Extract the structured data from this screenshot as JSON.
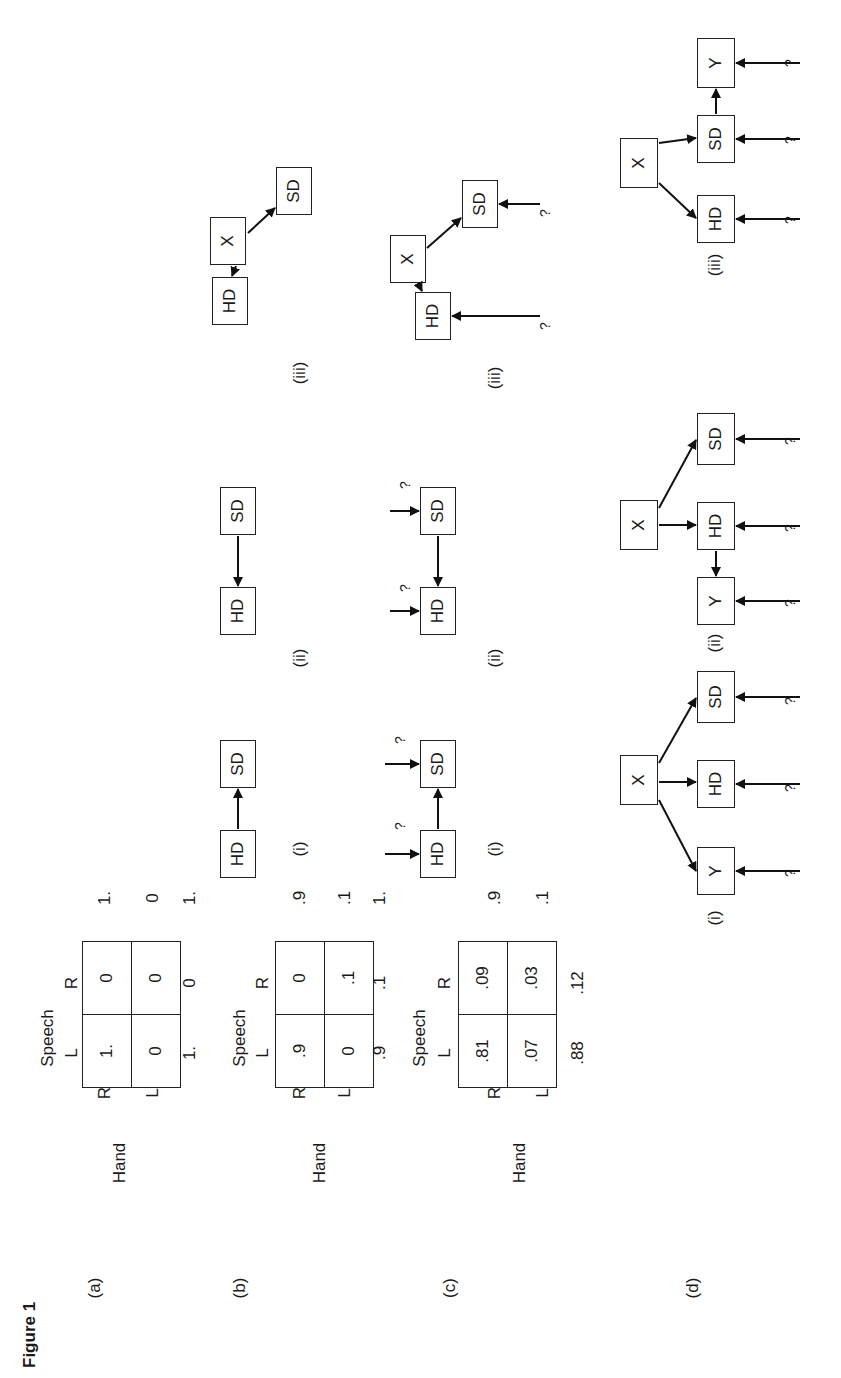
{
  "figure": {
    "caption": "Figure 1",
    "orientation": "rotated 90° counter-clockwise",
    "rows": [
      {
        "label": "(a)",
        "table": {
          "row_var": "Hand",
          "col_var": "Speech",
          "row_labels": [
            "R",
            "L"
          ],
          "col_labels": [
            "L",
            "R"
          ],
          "cells": [
            [
              "1.",
              "0"
            ],
            [
              "0",
              "0"
            ]
          ],
          "row_totals": [
            "1.",
            "0"
          ],
          "col_totals": [
            "1.",
            "0"
          ],
          "grand_total": "1."
        },
        "diagrams": []
      },
      {
        "label": "(b)",
        "table": {
          "row_var": "Hand",
          "col_var": "Speech",
          "row_labels": [
            "R",
            "L"
          ],
          "col_labels": [
            "L",
            "R"
          ],
          "cells": [
            [
              ".9",
              "0"
            ],
            [
              "0",
              ".1"
            ]
          ],
          "row_totals": [
            ".9",
            ".1"
          ],
          "col_totals": [
            ".9",
            ".1"
          ],
          "grand_total": "1."
        },
        "diagrams": [
          {
            "label": "(i)",
            "nodes": [
              "HD",
              "SD"
            ],
            "edges": [
              [
                "HD",
                "SD"
              ]
            ],
            "error_inputs": []
          },
          {
            "label": "(ii)",
            "nodes": [
              "HD",
              "SD"
            ],
            "edges": [
              [
                "SD",
                "HD"
              ]
            ],
            "error_inputs": []
          },
          {
            "label": "(iii)",
            "nodes": [
              "X",
              "HD",
              "SD"
            ],
            "edges": [
              [
                "X",
                "HD"
              ],
              [
                "X",
                "SD"
              ]
            ],
            "error_inputs": []
          }
        ]
      },
      {
        "label": "(c)",
        "table": {
          "row_var": "Hand",
          "col_var": "Speech",
          "row_labels": [
            "R",
            "L"
          ],
          "col_labels": [
            "L",
            "R"
          ],
          "cells": [
            [
              ".81",
              ".09"
            ],
            [
              ".07",
              ".03"
            ]
          ],
          "row_totals": [
            ".9",
            ".1"
          ],
          "col_totals": [
            ".88",
            ".12"
          ]
        },
        "diagrams": [
          {
            "label": "(i)",
            "nodes": [
              "HD",
              "SD"
            ],
            "edges": [
              [
                "HD",
                "SD"
              ]
            ],
            "error_inputs": [
              "HD",
              "SD"
            ],
            "error_symbol": "?"
          },
          {
            "label": "(ii)",
            "nodes": [
              "HD",
              "SD"
            ],
            "edges": [
              [
                "SD",
                "HD"
              ]
            ],
            "error_inputs": [
              "HD",
              "SD"
            ],
            "error_symbol": "?"
          },
          {
            "label": "(iii)",
            "nodes": [
              "X",
              "HD",
              "SD"
            ],
            "edges": [
              [
                "X",
                "HD"
              ],
              [
                "X",
                "SD"
              ]
            ],
            "error_inputs": [
              "HD",
              "SD"
            ],
            "error_symbol": "?"
          }
        ]
      },
      {
        "label": "(d)",
        "diagrams": [
          {
            "label": "(i)",
            "nodes": [
              "X",
              "Y",
              "HD",
              "SD"
            ],
            "edges": [
              [
                "X",
                "Y"
              ],
              [
                "X",
                "HD"
              ],
              [
                "X",
                "SD"
              ]
            ],
            "error_inputs": [
              "Y",
              "HD",
              "SD"
            ],
            "error_symbol": "?"
          },
          {
            "label": "(ii)",
            "nodes": [
              "X",
              "Y",
              "HD",
              "SD"
            ],
            "edges": [
              [
                "X",
                "HD"
              ],
              [
                "X",
                "SD"
              ],
              [
                "HD",
                "Y"
              ]
            ],
            "error_inputs": [
              "Y",
              "HD",
              "SD"
            ],
            "error_symbol": "?"
          },
          {
            "label": "(iii)",
            "nodes": [
              "X",
              "HD",
              "SD",
              "Y"
            ],
            "edges": [
              [
                "X",
                "HD"
              ],
              [
                "X",
                "SD"
              ],
              [
                "SD",
                "Y"
              ]
            ],
            "error_inputs": [
              "HD",
              "SD",
              "Y"
            ],
            "error_symbol": "?"
          }
        ]
      }
    ]
  }
}
